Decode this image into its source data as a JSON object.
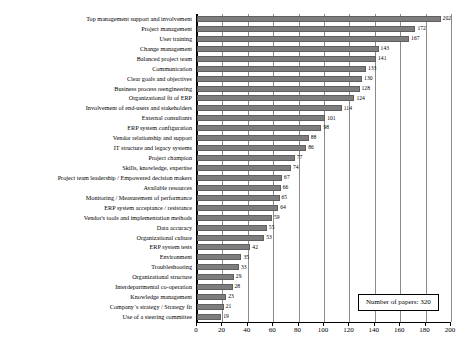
{
  "chart_data": {
    "type": "bar",
    "orientation": "horizontal",
    "title": "",
    "xlabel": "",
    "ylabel": "",
    "xlim": [
      0,
      200
    ],
    "xticks": [
      0,
      20,
      40,
      60,
      80,
      100,
      120,
      140,
      160,
      180,
      200
    ],
    "grid": true,
    "legend_position": "bottom-right",
    "bar_color": "#7d7d7d",
    "categories": [
      "Top management support and involvement",
      "Project management",
      "User training",
      "Change management",
      "Balanced project team",
      "Communication",
      "Clear goals and objectives",
      "Business process reengineering",
      "Organizational fit of ERP",
      "Involvement of end-users and stakeholders",
      "External consultants",
      "ERP system configuration",
      "Vendor relationship and support",
      "IT structure and legacy systems",
      "Project champion",
      "Skills, knowledge, expertise",
      "Project team leadership / Empowered decision makers",
      "Available resources",
      "Monitoring / Measurement of performance",
      "ERP system acceptance / resistance",
      "Vendor's tools and implementation methods",
      "Data accuracy",
      "Organizational culture",
      "ERP system tests",
      "Environment",
      "Troubleshooting",
      "Organizational structure",
      "Interdepartmental co-operation",
      "Knowledge management",
      "Company´s strategy / Strategy fit",
      "Use of a steering committee"
    ],
    "values": [
      202,
      172,
      167,
      143,
      141,
      133,
      130,
      128,
      124,
      114,
      101,
      98,
      88,
      86,
      77,
      74,
      67,
      66,
      65,
      64,
      59,
      55,
      53,
      42,
      35,
      33,
      29,
      28,
      23,
      21,
      19
    ]
  },
  "legend": {
    "text": "Number of papers: 320"
  }
}
